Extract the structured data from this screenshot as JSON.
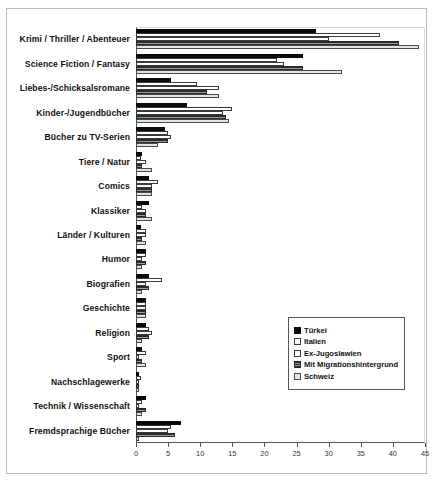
{
  "chart_data": {
    "type": "bar",
    "orientation": "horizontal",
    "title": "",
    "xlabel": "",
    "ylabel": "",
    "xlim": [
      0,
      45
    ],
    "xticks": [
      0,
      5,
      10,
      15,
      20,
      25,
      30,
      35,
      40,
      45
    ],
    "grid": false,
    "legend_position": "middle-right",
    "categories": [
      "Krimi / Thriller / Abenteuer",
      "Science Fiction / Fantasy",
      "Liebes-/Schicksalsromane",
      "Kinder-/Jugendbücher",
      "Bücher zu TV-Serien",
      "Tiere / Natur",
      "Comics",
      "Klassiker",
      "Länder / Kulturen",
      "Humor",
      "Biografien",
      "Geschichte",
      "Religion",
      "Sport",
      "Nachschlagewerke",
      "Technik / Wissenschaft",
      "Fremdsprachige Bücher"
    ],
    "series": [
      {
        "name": "Türkei",
        "color": "#0a0a0a",
        "values": [
          28,
          26,
          5.5,
          8,
          4.5,
          1,
          2,
          2,
          0.8,
          1.5,
          2,
          1.5,
          1.5,
          1,
          0.5,
          1.5,
          7
        ]
      },
      {
        "name": "Italien",
        "color": "#ffffff",
        "values": [
          38,
          22,
          9.5,
          15,
          5,
          0.8,
          3.5,
          1,
          1.5,
          1.5,
          4,
          1.5,
          2,
          1.5,
          0.8,
          1,
          5.5
        ]
      },
      {
        "name": "Ex-Jugoslawien",
        "color": "#ffffff",
        "values": [
          30,
          23,
          13,
          13.5,
          5.5,
          1.5,
          2.5,
          1.5,
          1.5,
          1,
          1.5,
          1.5,
          2.5,
          0.5,
          0.5,
          0.5,
          5
        ]
      },
      {
        "name": "Mit Migrationshintergrund",
        "color": "#2b2b2b",
        "values": [
          41,
          26,
          11,
          14,
          5,
          1,
          2.5,
          1.5,
          1,
          1.5,
          2,
          1.5,
          2,
          1,
          0.5,
          1.5,
          6
        ]
      },
      {
        "name": "Schweiz",
        "color": "#e2e2e2",
        "values": [
          44,
          32,
          13,
          14.5,
          3.5,
          2.5,
          2.5,
          2.5,
          1.5,
          1,
          1,
          1.5,
          1,
          1.5,
          0.5,
          1,
          0.5
        ]
      }
    ]
  }
}
